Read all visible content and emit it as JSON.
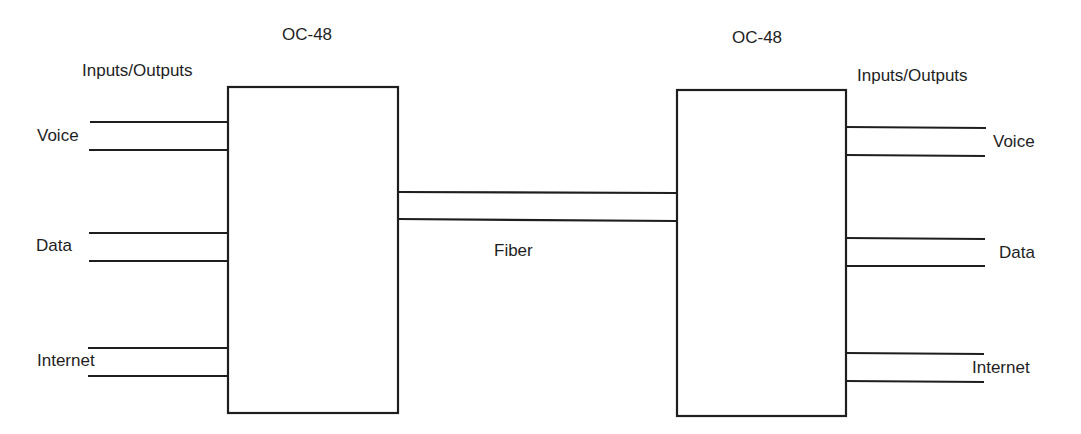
{
  "diagram": {
    "left_node": {
      "title": "OC-48",
      "io_label": "Inputs/Outputs",
      "ports": [
        {
          "label": "Voice"
        },
        {
          "label": "Data"
        },
        {
          "label": "Internet"
        }
      ]
    },
    "link": {
      "label": "Fiber"
    },
    "right_node": {
      "title": "OC-48",
      "io_label": "Inputs/Outputs",
      "ports": [
        {
          "label": "Voice"
        },
        {
          "label": "Data"
        },
        {
          "label": "Internet"
        }
      ]
    },
    "colors": {
      "stroke": "#1e1e1e",
      "background": "#ffffff"
    }
  }
}
